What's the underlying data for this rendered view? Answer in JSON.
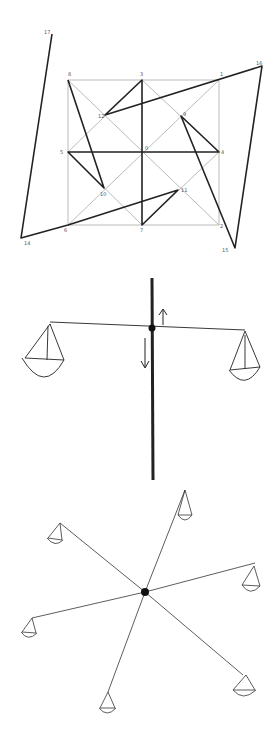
{
  "figure_1": {
    "title": "Square grid with superimposed star-polygon path",
    "labels": {
      "top_left_outer": "17",
      "top_right_outer": "16",
      "bottom_left_outer": "14",
      "bottom_right_outer": "15",
      "grid_tl": "8",
      "grid_tm": "3",
      "grid_tr": "1",
      "grid_ml": "5",
      "grid_c": "0",
      "grid_mr": "4",
      "grid_bl": "6",
      "grid_bm": "7",
      "grid_br": "2",
      "inner_ul": "12",
      "inner_ur": "9",
      "inner_ll": "10",
      "inner_lr": "11"
    }
  },
  "figure_2": {
    "title": "Balance scale with two pans on a vertical axis",
    "arrows": [
      "up",
      "down"
    ]
  },
  "figure_3": {
    "title": "Six-armed balance with pans radiating from a center point",
    "pan_count": 6
  }
}
